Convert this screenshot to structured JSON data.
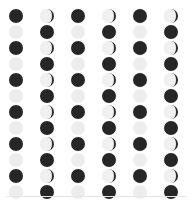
{
  "page": {
    "background_color": "#ffffff",
    "width": 193,
    "height": 204
  },
  "legend": {
    "new_moon_color": "#262626",
    "full_moon_color": "#ededed",
    "crescent_light_color": "#ebebeb",
    "crescent_dark_color": "#2b2b2b",
    "divider_color": "#e6e6e6"
  },
  "grid": {
    "columns": 6,
    "rows": 12,
    "column_spacing": 31,
    "row_spacing": 16,
    "first_column_x": 6,
    "first_row_y": 8,
    "icon_size": 14
  },
  "divider": {
    "name": "bottom-divider",
    "y": 196
  },
  "chart_data": {
    "type": "heatmap",
    "xlabel": "",
    "ylabel": "",
    "categories": [
      "col-1",
      "col-2",
      "col-3",
      "col-4",
      "col-5",
      "col-6"
    ],
    "row_labels": [
      "row-1",
      "row-2",
      "row-3",
      "row-4",
      "row-5",
      "row-6",
      "row-7",
      "row-8",
      "row-9",
      "row-10",
      "row-11",
      "row-12"
    ],
    "legend_entries": [
      "new-moon",
      "full-moon",
      "crescent-moon"
    ],
    "cells": [
      [
        "new-moon",
        "crescent-moon",
        "new-moon",
        "crescent-moon",
        "new-moon",
        "crescent-moon"
      ],
      [
        "full-moon",
        "new-moon",
        "full-moon",
        "new-moon",
        "full-moon",
        "new-moon"
      ],
      [
        "new-moon",
        "crescent-moon",
        "new-moon",
        "crescent-moon",
        "new-moon",
        "crescent-moon"
      ],
      [
        "full-moon",
        "new-moon",
        "full-moon",
        "new-moon",
        "full-moon",
        "new-moon"
      ],
      [
        "new-moon",
        "crescent-moon",
        "new-moon",
        "crescent-moon",
        "new-moon",
        "crescent-moon"
      ],
      [
        "full-moon",
        "new-moon",
        "full-moon",
        "new-moon",
        "full-moon",
        "new-moon"
      ],
      [
        "new-moon",
        "crescent-moon",
        "new-moon",
        "crescent-moon",
        "new-moon",
        "crescent-moon"
      ],
      [
        "full-moon",
        "new-moon",
        "full-moon",
        "new-moon",
        "full-moon",
        "new-moon"
      ],
      [
        "new-moon",
        "crescent-moon",
        "new-moon",
        "crescent-moon",
        "new-moon",
        "crescent-moon"
      ],
      [
        "full-moon",
        "new-moon",
        "full-moon",
        "new-moon",
        "full-moon",
        "new-moon"
      ],
      [
        "new-moon",
        "crescent-moon",
        "new-moon",
        "crescent-moon",
        "new-moon",
        "crescent-moon"
      ],
      [
        "full-moon",
        "new-moon",
        "full-moon",
        "new-moon",
        "full-moon",
        "new-moon"
      ]
    ]
  }
}
